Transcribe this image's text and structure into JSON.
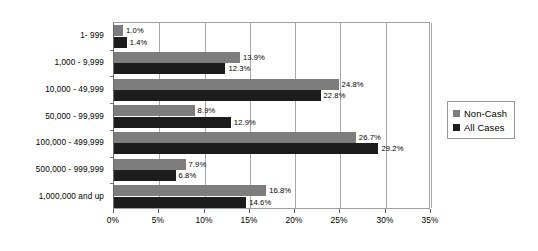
{
  "chart_data": {
    "type": "bar",
    "orientation": "horizontal",
    "title": "",
    "xlabel": "",
    "ylabel": "",
    "xlim": [
      0,
      35
    ],
    "xtick_labels": [
      "0%",
      "5%",
      "10%",
      "15%",
      "20%",
      "25%",
      "30%",
      "35%"
    ],
    "xticks": [
      0,
      5,
      10,
      15,
      20,
      25,
      30,
      35
    ],
    "grid": "vertical",
    "legend_position": "right",
    "categories": [
      "1- 999",
      "1,000 - 9,999",
      "10,000 - 49,999",
      "50,000 - 99,999",
      "100,000 - 499,999",
      "500,000 - 999,999",
      "1,000,000 and up"
    ],
    "series": [
      {
        "name": "Non-Cash",
        "color": "#7d7d7d",
        "values": [
          1.0,
          13.9,
          24.8,
          8.9,
          26.7,
          7.9,
          16.8
        ],
        "labels": [
          "1.0%",
          "13.9%",
          "24.8%",
          "8.9%",
          "26.7%",
          "7.9%",
          "16.8%"
        ]
      },
      {
        "name": "All Cases",
        "color": "#1c1c1c",
        "values": [
          1.4,
          12.3,
          22.8,
          12.9,
          29.2,
          6.8,
          14.6
        ],
        "labels": [
          "1.4%",
          "12.3%",
          "22.8%",
          "12.9%",
          "29.2%",
          "6.8%",
          "14.6%"
        ]
      }
    ]
  },
  "legend": {
    "items": [
      {
        "label": "Non-Cash",
        "color": "#7d7d7d"
      },
      {
        "label": "All Cases",
        "color": "#1c1c1c"
      }
    ]
  }
}
